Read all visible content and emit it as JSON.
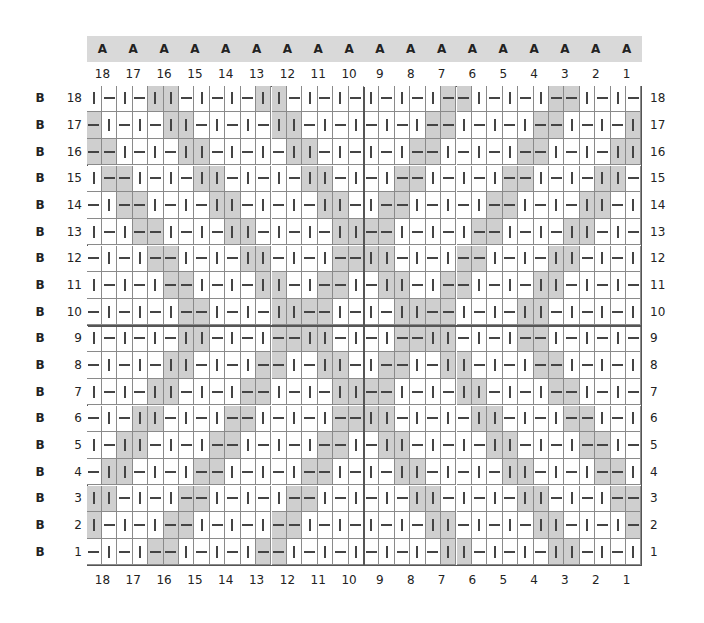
{
  "chart_data": {
    "type": "table",
    "title": "",
    "legend": {
      "v": "vertical bar symbol (|), unshaded",
      "h": "horizontal bar symbol (—), unshaded",
      "V": "vertical bar symbol (|), gray shaded",
      "H": "horizontal bar symbol (—), gray shaded"
    },
    "column_header_letter": "A",
    "row_header_letter": "B",
    "columns_top": [
      18,
      17,
      16,
      15,
      14,
      13,
      12,
      11,
      10,
      9,
      8,
      7,
      6,
      5,
      4,
      3,
      2,
      1
    ],
    "columns_bottom": [
      18,
      17,
      16,
      15,
      14,
      13,
      12,
      11,
      10,
      9,
      8,
      7,
      6,
      5,
      4,
      3,
      2,
      1
    ],
    "cells_per_column": 2,
    "rows": [
      {
        "label": 18,
        "cells": "vhvhVVhvhvhVVhvhvhvhvhvHHvhvhvHHvhvh"
      },
      {
        "label": 17,
        "cells": "HvhvhVVhvhvhVVhvhvhvhvHHvhvhvHHvhvhV"
      },
      {
        "label": 16,
        "cells": "HHvhvhVVhvhvhVVhvhvhvHHvhvhvHHvhvhVV"
      },
      {
        "label": 15,
        "cells": "vHHvhvhVVhvhvhVVhvhvHHvhvhvHHvhvhVVh"
      },
      {
        "label": 14,
        "cells": "hvHHvhvhVVhvhvhVVhvHHvhvhvHHvhvhVVhv"
      },
      {
        "label": 13,
        "cells": "vhvHHvhvhVVhvhvhVVHHvhvhvHHvhvhVVhvh"
      },
      {
        "label": 12,
        "cells": "hvhvHHvhvhVVhvhvHHVVhvhvHHvhvhVVhvhv"
      },
      {
        "label": 11,
        "cells": "vhvhvHHvhvhVVhvHHvhVVhvHHvhvhVVhvhvh"
      },
      {
        "label": 10,
        "cells": "hvhvhvHHvhvhVVHHvhvhVVHHvhvhVVhvhvhv"
      },
      {
        "label": 9,
        "cells": "vhvhvhVVhvhvHHVVhvhvHHVVhvhvHHvhvhvh"
      },
      {
        "label": 8,
        "cells": "hvhvhVVhvhvHHvhVVhvHHvhVVhvhvHHvhvhv"
      },
      {
        "label": 7,
        "cells": "vhvhVVhvhvHHvhvhVVHHvhvhVVhvhvHHvhvh"
      },
      {
        "label": 6,
        "cells": "hvhVVhvhvHHvhvhvHHVVhvhvhVVhvhvHHvhv"
      },
      {
        "label": 5,
        "cells": "vhVVhvhvHHvhvhvHHvhVVhvhvhVVhvhvHHvh"
      },
      {
        "label": 4,
        "cells": "hVVhvhvHHvhvhvHHvhvhVVhvhvhVVhvhvHHv"
      },
      {
        "label": 3,
        "cells": "VVhvhvHHvhvhvHHvhvhvhVVhvhvhVVhvhvHH"
      },
      {
        "label": 2,
        "cells": "VhvhvHHvhvhvHHvhvhvhvhVVhvhvhVVhvhvH"
      },
      {
        "label": 1,
        "cells": "hvhvHHvhvhvHHvhvhvhvhvhVVhvhvhVVhvhv"
      }
    ],
    "grid": {
      "columns": 36,
      "rows": 18
    },
    "colors": {
      "shade": "#cfcfcf",
      "header_band": "#d9d9d9",
      "line": "#8a8a8a",
      "symbol": "#444444"
    }
  }
}
